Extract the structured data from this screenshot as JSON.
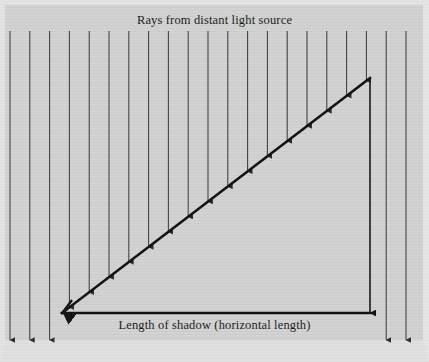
{
  "figure": {
    "width": 429,
    "height": 362,
    "background_color": "#d2d2d2",
    "border_color": "#e4e4e4",
    "ink_color": "#1c1c1c",
    "ray_color": "#3a3a3a",
    "title": "Rays from distant light source",
    "baseline_label": "Length of shadow (horizontal length)"
  },
  "chart_data": {
    "type": "diagram",
    "title": "Rays from distant light source",
    "xlabel": "Length of shadow (horizontal length)",
    "ylabel": "",
    "geometry": {
      "triangle": {
        "name": "shadow-triangle",
        "vertices": {
          "shadow_tip": [
            62,
            313
          ],
          "base_corner": [
            370,
            313
          ],
          "apex": [
            370,
            78
          ]
        },
        "horizontal_leg_label": "Length of shadow (horizontal length)",
        "horizontal_leg_length_px": 308,
        "vertical_leg_length_px": 235,
        "hypotenuse_slope": -0.763
      },
      "baseline": {
        "y": 313,
        "x_start": 62,
        "x_end": 370
      },
      "vertical_leg": {
        "x": 370,
        "y_start": 78,
        "y_end": 313
      }
    },
    "rays": {
      "direction": "downward",
      "count": 21,
      "top_y": 31,
      "spacing_px": 19.8,
      "x_positions": [
        10,
        29.8,
        49.6,
        69.4,
        89.2,
        109,
        128.8,
        148.6,
        168.4,
        188.2,
        208,
        227.8,
        247.6,
        267.4,
        287.2,
        307,
        326.8,
        346.6,
        366.4,
        386.2,
        406
      ],
      "note": "Each ray terminates with an arrowhead where it meets the hypotenuse, the baseline, or the bottom of the plate."
    },
    "legend": []
  },
  "icons": {
    "ray_arrow": "arrow-down-icon"
  }
}
